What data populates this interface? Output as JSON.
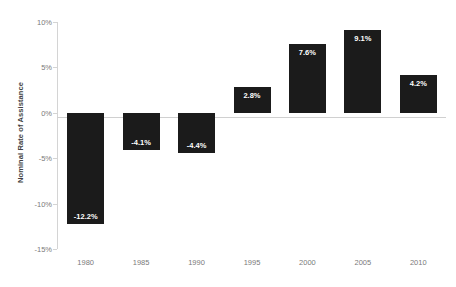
{
  "chart_data": {
    "type": "bar",
    "title": "",
    "xlabel": "",
    "ylabel": "Nominal Rate of Assistance",
    "categories": [
      "1980",
      "1985",
      "1990",
      "1995",
      "2000",
      "2005",
      "2010"
    ],
    "values": [
      -12.2,
      -4.1,
      -4.4,
      2.8,
      7.6,
      9.1,
      4.2
    ],
    "data_labels": [
      "-12.2%",
      "-4.1%",
      "-4.4%",
      "2.8%",
      "7.6%",
      "9.1%",
      "4.2%"
    ],
    "ylim": [
      -15,
      10
    ],
    "y_ticks": [
      10,
      5,
      0,
      -5,
      -10,
      -15
    ],
    "y_tick_labels": [
      "10%",
      "5%",
      "0%",
      "-5%",
      "-10%",
      "-15%"
    ],
    "grid": false,
    "legend": null,
    "legend_position": "none",
    "series": [
      {
        "name": "Nominal Rate of Assistance",
        "values": [
          -12.2,
          -4.1,
          -4.4,
          2.8,
          7.6,
          9.1,
          4.2
        ]
      }
    ],
    "colors": {
      "bar": "#1b1b1b",
      "bar_label_text": "#ffffff",
      "axis_line": "#d4d4d4",
      "zero_line": "#d0d0d0",
      "tick_text": "#7a7a7a",
      "axis_title_text": "#404040",
      "background": "#ffffff"
    }
  }
}
